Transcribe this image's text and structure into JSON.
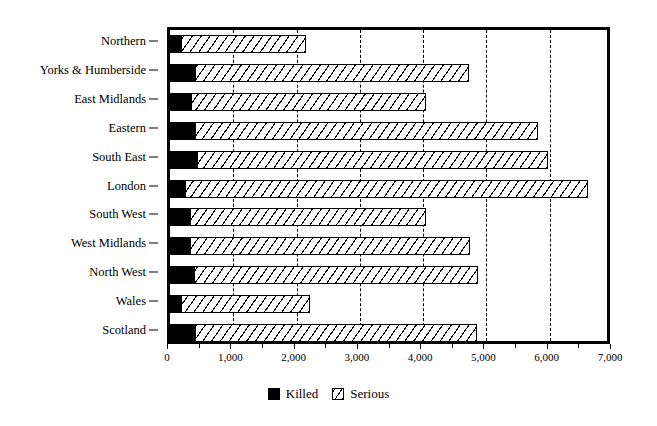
{
  "chart_data": {
    "type": "bar",
    "orientation": "horizontal",
    "stacked": true,
    "title": "",
    "subtitle": "",
    "xlabel": "",
    "ylabel": "",
    "xlim": [
      0,
      7000
    ],
    "ylim": null,
    "grid": true,
    "grid_style": "dashed vertical gridlines at 1,000 intervals",
    "legend_position": "bottom-center",
    "categories": [
      "Northern",
      "Yorks & Humberside",
      "East Midlands",
      "Eastern",
      "South East",
      "London",
      "South West",
      "West Midlands",
      "North West",
      "Wales",
      "Scotland"
    ],
    "series": [
      {
        "name": "Killed",
        "color": "#000000",
        "fill": "solid-black",
        "values": [
          175,
          390,
          330,
          400,
          420,
          240,
          320,
          320,
          380,
          175,
          400
        ]
      },
      {
        "name": "Serious",
        "color": "#ffffff",
        "fill": "diagonal-hatch",
        "values": [
          1975,
          4330,
          3710,
          5420,
          5560,
          6360,
          3720,
          4420,
          4480,
          2040,
          4450
        ]
      }
    ],
    "totals": [
      2150,
      4720,
      4040,
      5820,
      5980,
      6600,
      4040,
      4740,
      4860,
      2215,
      4850
    ],
    "xticks": [
      0,
      1000,
      2000,
      3000,
      4000,
      5000,
      6000,
      7000
    ],
    "xtick_labels": [
      "0",
      "1,000",
      "2,000",
      "3,000",
      "4,000",
      "5,000",
      "6,000",
      "7,000"
    ],
    "xtick_minor_interval": 500
  },
  "legend": {
    "items": [
      {
        "label": "Killed",
        "swatch": "solid-black-square-icon"
      },
      {
        "label": "Serious",
        "swatch": "hatched-square-icon"
      }
    ]
  },
  "axis": {
    "x_tick_labels": [
      "0",
      "1,000",
      "2,000",
      "3,000",
      "4,000",
      "5,000",
      "6,000",
      "7,000"
    ],
    "y_tick_labels": [
      "Northern",
      "Yorks & Humberside",
      "East Midlands",
      "Eastern",
      "South East",
      "London",
      "South West",
      "West Midlands",
      "North West",
      "Wales",
      "Scotland"
    ]
  }
}
